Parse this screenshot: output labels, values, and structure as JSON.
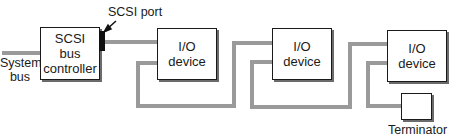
{
  "diagram": {
    "colors": {
      "bus_line": "#9a9a9a",
      "box_border": "#1a1a1a",
      "port": "#111111",
      "shadow": "#6b6b6b"
    },
    "system_bus": {
      "line1": "System",
      "line2": "bus"
    },
    "controller": {
      "line1": "SCSI",
      "line2": "bus",
      "line3": "controller"
    },
    "port_label": "SCSI port",
    "devices": [
      {
        "line1": "I/O",
        "line2": "device"
      },
      {
        "line1": "I/O",
        "line2": "device"
      },
      {
        "line1": "I/O",
        "line2": "device"
      }
    ],
    "terminator_label": "Terminator"
  }
}
